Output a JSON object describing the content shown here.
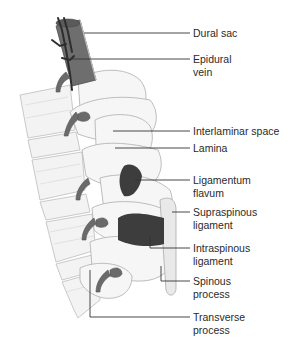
{
  "diagram": {
    "colors": {
      "bone": "#f2f2f2",
      "bone_outline": "#b9b9b9",
      "dural_sac": "#6e6e6e",
      "vein": "#3c3c3c",
      "nerve_root": "#707070",
      "ligament": "#3a3a3a",
      "leader_line": "#333333",
      "label_text": "#2a2a2a"
    },
    "labels": [
      {
        "id": "dural-sac",
        "text": "Dural sac",
        "top": 27
      },
      {
        "id": "epidural-vein",
        "text": "Epidural\nvein",
        "top": 53
      },
      {
        "id": "interlaminar-space",
        "text": "Interlaminar space",
        "top": 125
      },
      {
        "id": "lamina",
        "text": "Lamina",
        "top": 142
      },
      {
        "id": "ligamentum-flavum",
        "text": "Ligamentum\nflavum",
        "top": 174
      },
      {
        "id": "supraspinous-ligament",
        "text": "Supraspinous\nligament",
        "top": 206
      },
      {
        "id": "intraspinous-ligament",
        "text": "Intraspinous\nligament",
        "top": 242
      },
      {
        "id": "spinous-process",
        "text": "Spinous\nprocess",
        "top": 275
      },
      {
        "id": "transverse-process",
        "text": "Transverse\nprocess",
        "top": 311
      }
    ]
  }
}
